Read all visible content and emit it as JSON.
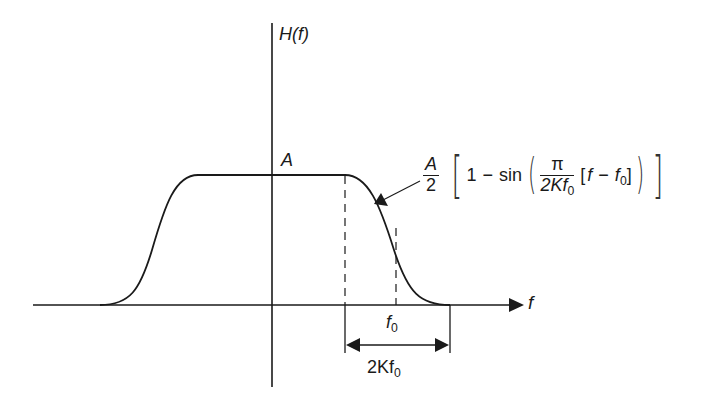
{
  "figure": {
    "type": "raised-cosine-style spectrum",
    "y_axis_label": "H(f)",
    "x_axis_label": "f",
    "plateau_label": "A",
    "center_freq_label": {
      "main": "f",
      "sub": "0"
    },
    "width_label": {
      "main": "2Kf",
      "sub": "0"
    },
    "formula": {
      "coef_num": "A",
      "coef_den": "2",
      "one": "1",
      "minus": "−",
      "sin": "sin",
      "pi": "π",
      "den_main": "2Kf",
      "den_sub": "0",
      "bracket_open": "[",
      "f": "f",
      "minus2": "−",
      "f0_main": "f",
      "f0_sub": "0",
      "bracket_close": "]"
    }
  },
  "colors": {
    "stroke": "#1a1a1a",
    "background": "#ffffff"
  }
}
